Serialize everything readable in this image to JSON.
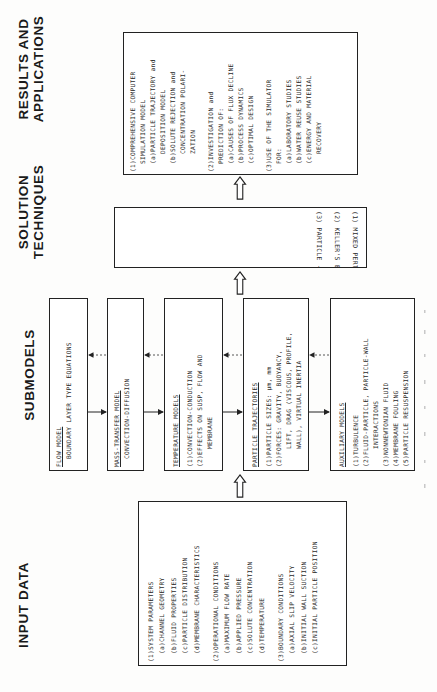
{
  "headings": {
    "input": "INPUT DATA",
    "submodels": "SUBMODELS",
    "solution_line1": "SOLUTION",
    "solution_line2": "TECHNIQUES",
    "results_line1": "RESULTS AND",
    "results_line2": "APPLICATIONS"
  },
  "results": {
    "items": [
      {
        "label": "(1)COMPREHENSIVE COMPUTER",
        "indent": 0
      },
      {
        "label": "SIMULATION MODEL",
        "indent": 1
      },
      {
        "label": "(a)PARTICLE TRAJECTORY and",
        "indent": 1
      },
      {
        "label": "DEPOSITION MODEL",
        "indent": 2
      },
      {
        "label": "(b)SOLUTE REJECTION and",
        "indent": 1
      },
      {
        "label": "CONCENTRATION POLARI-",
        "indent": 2
      },
      {
        "label": "ZATION",
        "indent": 2
      },
      {
        "label": "",
        "indent": -1
      },
      {
        "label": "(2)INVESTIGATION and",
        "indent": 0
      },
      {
        "label": "PREDICTION OF:",
        "indent": 1
      },
      {
        "label": "(a)CAUSES OF FLUX DECLINE",
        "indent": 1
      },
      {
        "label": "(b)PROCESS DYNAMICS",
        "indent": 1
      },
      {
        "label": "(c)OPTIMAL DESIGN",
        "indent": 1
      },
      {
        "label": "",
        "indent": -1
      },
      {
        "label": "(3)USE OF THE SIMULATOR",
        "indent": 0
      },
      {
        "label": "FOR:",
        "indent": 1
      },
      {
        "label": "(a)LABORATORY STUDIES",
        "indent": 1
      },
      {
        "label": "(b)WATER REUSE STUDIES",
        "indent": 1
      },
      {
        "label": "(c)ENERGY AND MATERIAL",
        "indent": 1
      },
      {
        "label": "RECOVERY",
        "indent": 2
      }
    ]
  },
  "solution": {
    "items": [
      "(1)  MIXED PERTURBATION/FINITE DIFFERENCE SCHEMES",
      "(2)  KELLER'S BOX METHOD FOR POROUS DUCT FLOW",
      "(3)  PARTICLE - SOURCE - IN-CELL METHOD"
    ]
  },
  "submodels": {
    "flow": {
      "title": "FLOW MODEL",
      "lines": [
        "BOUNDARY LAYER TYPE EQUATIONS"
      ]
    },
    "mass": {
      "title": "MASS-TRANSFER MODEL",
      "lines": [
        "CONVECTION-DIFFUSION"
      ]
    },
    "temperature": {
      "title": "TEMPERATURE MODELS",
      "lines": [
        "(1)CONVECTION-CONDUCTION",
        "(2)EFFECTS ON SUSP, FLOW AND",
        "MEMBRANE"
      ]
    },
    "particle": {
      "title": "PARTICLE TRAJECTORIES",
      "lines": [
        "(1)PARTICLE SIZES: μm, mm",
        "(2)FORCES: GRAVITY, BUOYANCY,",
        "LIFT, DRAG (VISCOUS, PROFILE,",
        "WALL), VIRTUAL INERTIA"
      ]
    },
    "auxiliary": {
      "title": "AUXILIARY MODELS",
      "lines": [
        "(1)TURBULENCE",
        "(2)FLUID-PARTICLE, PARTICLE-WALL",
        "INTERACTIONS",
        "(3)NONNEWTONIAN FLUID",
        "(4)MEMBRANE FOULING",
        "(5)PARTICLE RESUSPENSION"
      ]
    }
  },
  "input": {
    "items": [
      {
        "label": "(1)SYSTEM PARAMETERS",
        "indent": 0
      },
      {
        "label": "(a)CHANNEL GEOMETRY",
        "indent": 1
      },
      {
        "label": "(b)FLUID PROPERTIES",
        "indent": 1
      },
      {
        "label": "(c)PARTICLE DISTRIBUTION",
        "indent": 1
      },
      {
        "label": "(d)MEMBRANE CHARACTERISTICS",
        "indent": 1
      },
      {
        "label": "",
        "indent": -1
      },
      {
        "label": "(2)OPERATIONAL CONDITIONS",
        "indent": 0
      },
      {
        "label": "(a)MAXIMUM FLOW RATE",
        "indent": 1
      },
      {
        "label": "(b)APPLIED PRESSURE",
        "indent": 1
      },
      {
        "label": "(c)SOLUTE CONCENTRATION",
        "indent": 1
      },
      {
        "label": "(d)TEMPERATURE",
        "indent": 1
      },
      {
        "label": "",
        "indent": -1
      },
      {
        "label": "(3)BOUNDARY CONDITIONS",
        "indent": 0
      },
      {
        "label": "(a)AXIAL SLIP VELOCITY",
        "indent": 1
      },
      {
        "label": "(b)INITIAL WALL SUCTION",
        "indent": 1
      },
      {
        "label": "(c)INITIAL PARTICLE POSITION",
        "indent": 1
      }
    ]
  },
  "colors": {
    "line": "#222222",
    "text": "#2a2a2a",
    "background": "#fdfdfc"
  }
}
